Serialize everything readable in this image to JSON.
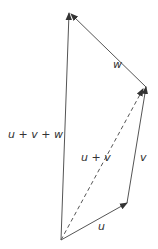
{
  "diagram": {
    "colors": {
      "line": "#555555",
      "text": "#333333",
      "background": "#ffffff"
    },
    "points": {
      "origin": [
        61,
        240
      ],
      "u_end": [
        127,
        203
      ],
      "uv_end": [
        146,
        87
      ],
      "uvw_end": [
        69,
        13
      ]
    },
    "vectors": [
      {
        "id": "u",
        "label": "u",
        "from": "origin",
        "to": "u_end",
        "style": "solid"
      },
      {
        "id": "v",
        "label": "v",
        "from": "u_end",
        "to": "uv_end",
        "style": "solid"
      },
      {
        "id": "w",
        "label": "w",
        "from": "uv_end",
        "to": "uvw_end",
        "style": "solid"
      },
      {
        "id": "u_plus_v",
        "label": "u + v",
        "from": "origin",
        "to": "uv_end",
        "style": "dashed"
      },
      {
        "id": "u_plus_v_plus_w",
        "label": "u + v + w",
        "from": "origin",
        "to": "uvw_end",
        "style": "solid"
      }
    ],
    "labels": {
      "u": "u",
      "v": "v",
      "w": "w",
      "u_plus_v": "u + v",
      "u_plus_v_plus_w": "u + v + w"
    }
  }
}
